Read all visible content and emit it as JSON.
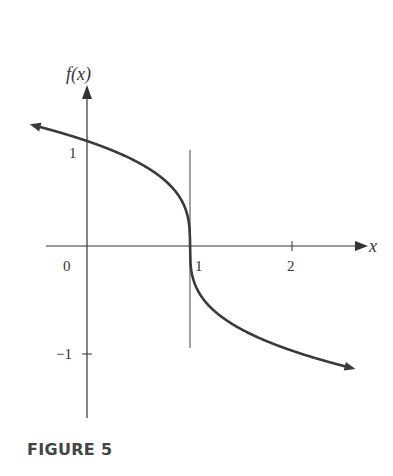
{
  "caption": "FIGURE 5",
  "chart_data": {
    "type": "line",
    "title": "",
    "function": "f(x) = -(x-1)^(1/3)",
    "xlabel": "x",
    "ylabel": "f(x)",
    "x_ticks": [
      {
        "value": 0,
        "label": "0"
      },
      {
        "value": 1,
        "label": "1"
      },
      {
        "value": 2,
        "label": "2"
      }
    ],
    "y_ticks": [
      {
        "value": 1,
        "label": "1"
      },
      {
        "value": -1,
        "label": "-1"
      }
    ],
    "xlim": [
      -0.4,
      2.75
    ],
    "ylim": [
      -1.6,
      1.5
    ],
    "vertical_line": {
      "x": 1,
      "note": "vertical tangent at x = 1"
    },
    "series": [
      {
        "name": "f(x)",
        "x": [
          -0.55,
          0,
          0.5,
          0.9,
          1,
          1.1,
          1.5,
          2,
          2.6
        ],
        "values": [
          1.16,
          1.0,
          0.79,
          0.46,
          0,
          -0.46,
          -0.79,
          -1.0,
          -1.17
        ]
      }
    ],
    "grid": false,
    "legend": null
  },
  "labels": {
    "ylabel": "f(x)",
    "xlabel": "x",
    "tick_x0": "0",
    "tick_x1": "1",
    "tick_x2": "2",
    "tick_y1": "1",
    "tick_ym1": "−1"
  }
}
